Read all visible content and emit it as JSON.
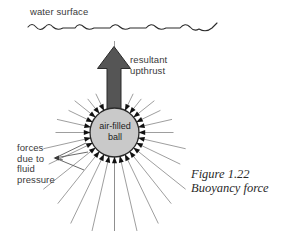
{
  "figure": {
    "caption": "Figure 1.22\nBuoyancy force",
    "caption_title": "Figure 1.22",
    "caption_subtitle": "Buoyancy force"
  },
  "labels": {
    "water_surface": "water surface",
    "resultant_upthrust": "resultant\nupthrust",
    "forces_due_to_fluid_pressure": "forces\ndue to\nfluid\npressure",
    "ball": "air-filled\nball"
  },
  "colors": {
    "background": "#ffffff",
    "arrow_fill": "#555555",
    "arrow_stroke": "#2b2b2b",
    "ball_fill": "#c9c9c9",
    "ball_stroke": "#2b2b2b",
    "pressure_line": "#8d8d8d",
    "pressure_head": "#111111",
    "text": "#3a3a3a",
    "wave_line": "#2b2b2b"
  },
  "geometry": {
    "ball_center_x": 114.5,
    "ball_center_y": 132.5,
    "ball_radius": 24.5,
    "arrow_tip_y": 47,
    "arrow_shaft_bottom_y": 112,
    "pressure_arrow_count": 28
  },
  "chart_data": {
    "type": "diagram",
    "title": "Buoyancy force",
    "elements": [
      {
        "name": "water-surface",
        "kind": "wavy-line",
        "label": "water surface"
      },
      {
        "name": "air-filled-ball",
        "kind": "circle",
        "label": "air-filled ball"
      },
      {
        "name": "resultant-upthrust-arrow",
        "kind": "arrow",
        "direction": "up",
        "label": "resultant upthrust"
      },
      {
        "name": "fluid-pressure-forces",
        "kind": "radial-arrows",
        "count": 28,
        "direction": "inward",
        "label": "forces due to fluid pressure"
      }
    ]
  }
}
